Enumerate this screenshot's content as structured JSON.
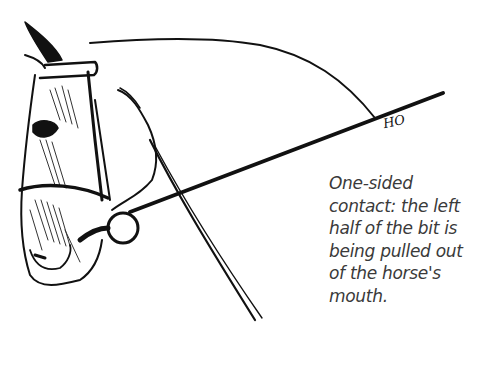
{
  "figure": {
    "signature": "HO",
    "caption_lines": [
      "One-sided",
      "contact: the left",
      "half of the bit is",
      "being pulled out",
      "of the horse's",
      "mouth."
    ]
  },
  "colors": {
    "ink": "#111111",
    "caption_text": "#3a3a3a",
    "background": "#ffffff"
  }
}
